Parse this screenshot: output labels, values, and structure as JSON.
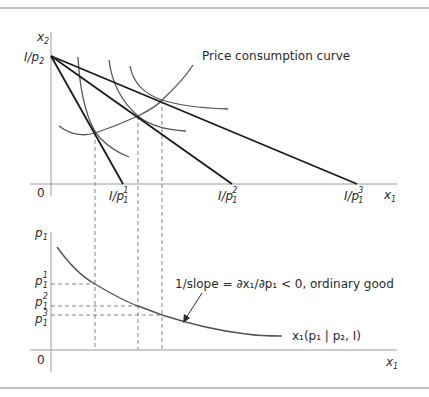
{
  "top_panel": {
    "y_axis_label": "x",
    "y_axis_label_sub": "2",
    "y_intercept_label": "I/p",
    "y_intercept_label_sub": "2",
    "origin_label": "0",
    "x_axis_label": "x",
    "x_axis_label_sub": "1",
    "x_intercepts": [
      {
        "label": "I/p",
        "sub": "1",
        "sup": "1"
      },
      {
        "label": "I/p",
        "sub": "1",
        "sup": "2"
      },
      {
        "label": "I/p",
        "sub": "1",
        "sup": "3"
      }
    ],
    "curve_label": "Price consumption curve"
  },
  "bottom_panel": {
    "y_axis_label": "p",
    "y_axis_label_sub": "1",
    "origin_label": "0",
    "x_axis_label": "x",
    "x_axis_label_sub": "1",
    "price_levels": [
      {
        "label": "p",
        "sub": "1",
        "sup": "1"
      },
      {
        "label": "p",
        "sub": "1",
        "sup": "2"
      },
      {
        "label": "p",
        "sub": "1",
        "sup": "3"
      }
    ],
    "annotation": "1/slope = ∂x₁/∂p₁ < 0, ordinary good",
    "demand_label": "x₁(p₁ | p₂, I)"
  },
  "colors": {
    "axis": "#9a9a9a",
    "budget_line": "#1a1a1a",
    "curve": "#555555",
    "dashed": "#777777",
    "frame": "#8a8a8a",
    "text": "#2a2a2a"
  }
}
